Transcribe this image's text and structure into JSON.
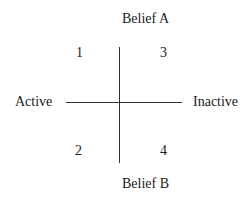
{
  "diagram": {
    "type": "quadrant",
    "axes": {
      "vertical": {
        "top_label": "Belief A",
        "bottom_label": "Belief B"
      },
      "horizontal": {
        "left_label": "Active",
        "right_label": "Inactive"
      }
    },
    "quadrants": [
      {
        "number": "1",
        "position": "top-left",
        "axis_values": [
          "Active",
          "Belief A"
        ]
      },
      {
        "number": "2",
        "position": "bottom-left",
        "axis_values": [
          "Active",
          "Belief B"
        ]
      },
      {
        "number": "3",
        "position": "top-right",
        "axis_values": [
          "Inactive",
          "Belief A"
        ]
      },
      {
        "number": "4",
        "position": "bottom-right",
        "axis_values": [
          "Inactive",
          "Belief B"
        ]
      }
    ],
    "colors": {
      "background": "#ffffff",
      "ink": "#1a1a1a",
      "line": "#333333"
    }
  }
}
